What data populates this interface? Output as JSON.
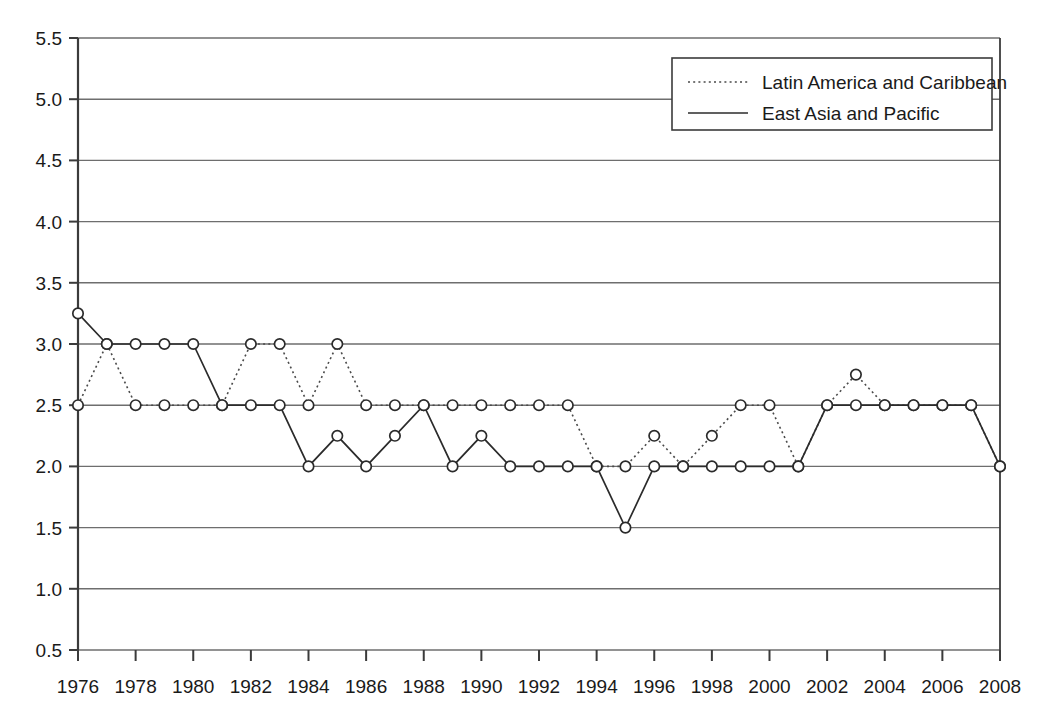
{
  "chart_data": {
    "type": "line",
    "title": "",
    "subtitle": "",
    "xlabel": "",
    "ylabel": "",
    "xlim": [
      1976,
      2008
    ],
    "ylim": [
      0.5,
      5.5
    ],
    "grid": true,
    "legend_position": "top-right",
    "x": [
      1976,
      1977,
      1978,
      1979,
      1980,
      1981,
      1982,
      1983,
      1984,
      1985,
      1986,
      1987,
      1988,
      1989,
      1990,
      1991,
      1992,
      1993,
      1994,
      1995,
      1996,
      1997,
      1998,
      1999,
      2000,
      2001,
      2002,
      2003,
      2004,
      2005,
      2006,
      2007,
      2008
    ],
    "x_tick_labels": [
      "1976",
      "1978",
      "1980",
      "1982",
      "1984",
      "1986",
      "1988",
      "1990",
      "1992",
      "1994",
      "1996",
      "1998",
      "2000",
      "2002",
      "2004",
      "2006",
      "2008"
    ],
    "x_tick_values": [
      1976,
      1978,
      1980,
      1982,
      1984,
      1986,
      1988,
      1990,
      1992,
      1994,
      1996,
      1998,
      2000,
      2002,
      2004,
      2006,
      2008
    ],
    "y_tick_labels": [
      "0.5",
      "1.0",
      "1.5",
      "2.0",
      "2.5",
      "3.0",
      "3.5",
      "4.0",
      "4.5",
      "5.0",
      "5.5"
    ],
    "y_tick_values": [
      0.5,
      1.0,
      1.5,
      2.0,
      2.5,
      3.0,
      3.5,
      4.0,
      4.5,
      5.0,
      5.5
    ],
    "series": [
      {
        "name": "Latin America and Caribbean",
        "style": "dotted",
        "values": [
          2.5,
          3.0,
          2.5,
          2.5,
          2.5,
          2.5,
          3.0,
          3.0,
          2.5,
          3.0,
          2.5,
          2.5,
          2.5,
          2.5,
          2.5,
          2.5,
          2.5,
          2.5,
          2.0,
          2.0,
          2.25,
          2.0,
          2.25,
          2.5,
          2.5,
          2.0,
          2.5,
          2.75,
          2.5,
          2.5,
          2.5,
          2.5,
          2.0
        ]
      },
      {
        "name": "East Asia and Pacific",
        "style": "solid",
        "values": [
          3.25,
          3.0,
          3.0,
          3.0,
          3.0,
          2.5,
          2.5,
          2.5,
          2.0,
          2.25,
          2.0,
          2.25,
          2.5,
          2.0,
          2.25,
          2.0,
          2.0,
          2.0,
          2.0,
          1.5,
          2.0,
          2.0,
          2.0,
          2.0,
          2.0,
          2.0,
          2.5,
          2.5,
          2.5,
          2.5,
          2.5,
          2.5,
          2.0
        ]
      }
    ]
  },
  "legend": {
    "entries": [
      {
        "label": "Latin America and Caribbean",
        "style": "dotted"
      },
      {
        "label": "East Asia and Pacific",
        "style": "solid"
      }
    ]
  }
}
